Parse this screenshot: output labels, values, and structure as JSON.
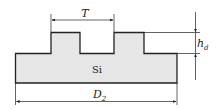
{
  "diagram": {
    "material_label": "Si",
    "dimensions": {
      "period": {
        "label": "T"
      },
      "height": {
        "label": "h",
        "subscript": "d"
      },
      "width": {
        "label": "D",
        "subscript": "2"
      }
    },
    "colors": {
      "fill": "#e6e6e6",
      "stroke": "#222222"
    }
  }
}
